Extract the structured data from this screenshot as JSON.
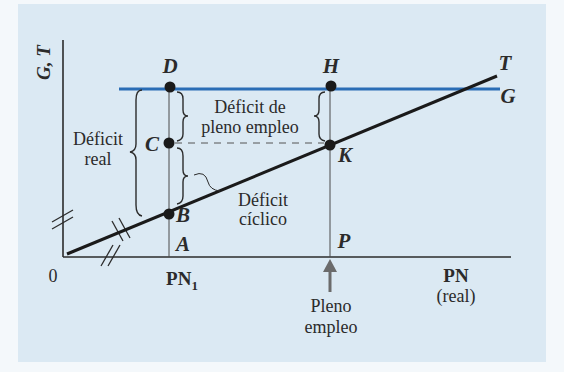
{
  "figure": {
    "y_axis_label": "G, T",
    "x_axis_label": "PN",
    "x_axis_sublabel": "(real)",
    "origin_label": "0",
    "pn1_label": "PN",
    "pn1_subscript": "1",
    "full_employment_label_line1": "Pleno",
    "full_employment_label_line2": "empleo",
    "points": {
      "D": "D",
      "C": "C",
      "B": "B",
      "A": "A",
      "H": "H",
      "K": "K",
      "P": "P"
    },
    "lines": {
      "T": "T",
      "G": "G"
    },
    "annotations": {
      "deficit_real_line1": "Déficit",
      "deficit_real_line2": "real",
      "deficit_full_line1": "Déficit de",
      "deficit_full_line2": "pleno empleo",
      "deficit_cyclic_line1": "Déficit",
      "deficit_cyclic_line2": "cíclico"
    },
    "colors": {
      "background": "#dbe9f3",
      "g_line": "#2a6db5",
      "t_line": "#1a1a1a",
      "arrow": "#6b6b6b"
    }
  }
}
